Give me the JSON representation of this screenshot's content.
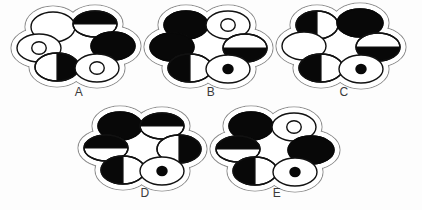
{
  "figure": {
    "title": "",
    "background_color": "#fdfdfd",
    "outline_color": "#8d8d8d",
    "cell_outline_color": "#111111",
    "fill_color": "#080808"
  },
  "clusters": [
    {
      "id": "A",
      "label": "A",
      "center": {
        "x": 79,
        "y": 45
      },
      "label_pos": {
        "x": 64,
        "y": 85
      },
      "cells": [
        {
          "position": "top-left",
          "cx": -26,
          "cy": -18,
          "rx": 22,
          "ry": 15,
          "state": "empty",
          "fill": "none"
        },
        {
          "position": "top-right",
          "cx": 16,
          "cy": -21,
          "rx": 22,
          "ry": 13,
          "state": "half-top",
          "fill": "top"
        },
        {
          "position": "left",
          "cx": -40,
          "cy": 3,
          "rx": 22,
          "ry": 14,
          "state": "ring-small",
          "fill": "inner-ring"
        },
        {
          "position": "right",
          "cx": 34,
          "cy": 1,
          "rx": 22,
          "ry": 14,
          "state": "full",
          "fill": "all"
        },
        {
          "position": "bottom-left",
          "cx": -22,
          "cy": 22,
          "rx": 22,
          "ry": 14,
          "state": "half-right",
          "fill": "right"
        },
        {
          "position": "bottom-right",
          "cx": 18,
          "cy": 23,
          "rx": 22,
          "ry": 14,
          "state": "ring-small",
          "fill": "inner-ring"
        }
      ]
    },
    {
      "id": "B",
      "label": "B",
      "center": {
        "x": 211,
        "y": 45
      },
      "label_pos": {
        "x": 196,
        "y": 85
      },
      "cells": [
        {
          "position": "top-left",
          "cx": -25,
          "cy": -20,
          "rx": 22,
          "ry": 14,
          "state": "full",
          "fill": "all"
        },
        {
          "position": "top-right",
          "cx": 17,
          "cy": -20,
          "rx": 22,
          "ry": 14,
          "state": "ring-small",
          "fill": "inner-ring"
        },
        {
          "position": "left",
          "cx": -39,
          "cy": 2,
          "rx": 22,
          "ry": 14,
          "state": "full",
          "fill": "all"
        },
        {
          "position": "right",
          "cx": 34,
          "cy": 3,
          "rx": 22,
          "ry": 14,
          "state": "half-bottom",
          "fill": "bottom"
        },
        {
          "position": "bottom-left",
          "cx": -21,
          "cy": 23,
          "rx": 22,
          "ry": 14,
          "state": "half-left",
          "fill": "left"
        },
        {
          "position": "bottom-right",
          "cx": 17,
          "cy": 24,
          "rx": 22,
          "ry": 14,
          "state": "dot-small",
          "fill": "inner-dot"
        }
      ]
    },
    {
      "id": "C",
      "label": "C",
      "center": {
        "x": 344,
        "y": 45
      },
      "label_pos": {
        "x": 329,
        "y": 85
      },
      "cells": [
        {
          "position": "top-left",
          "cx": -27,
          "cy": -20,
          "rx": 21,
          "ry": 14,
          "state": "half-left",
          "fill": "left"
        },
        {
          "position": "top-right",
          "cx": 16,
          "cy": -22,
          "rx": 23,
          "ry": 14,
          "state": "full",
          "fill": "all"
        },
        {
          "position": "left",
          "cx": -40,
          "cy": 1,
          "rx": 22,
          "ry": 14,
          "state": "empty",
          "fill": "none"
        },
        {
          "position": "right",
          "cx": 34,
          "cy": 2,
          "rx": 22,
          "ry": 14,
          "state": "half-bottom",
          "fill": "bottom"
        },
        {
          "position": "bottom-left",
          "cx": -23,
          "cy": 23,
          "rx": 22,
          "ry": 14,
          "state": "half-left",
          "fill": "left"
        },
        {
          "position": "bottom-right",
          "cx": 17,
          "cy": 24,
          "rx": 22,
          "ry": 14,
          "state": "dot-small",
          "fill": "inner-dot"
        }
      ]
    },
    {
      "id": "D",
      "label": "D",
      "center": {
        "x": 145,
        "y": 148
      },
      "label_pos": {
        "x": 130,
        "y": 186
      },
      "cells": [
        {
          "position": "top-left",
          "cx": -25,
          "cy": -22,
          "rx": 22,
          "ry": 14,
          "state": "full",
          "fill": "all"
        },
        {
          "position": "top-right",
          "cx": 17,
          "cy": -22,
          "rx": 22,
          "ry": 13,
          "state": "half-top",
          "fill": "top"
        },
        {
          "position": "left",
          "cx": -39,
          "cy": 0,
          "rx": 22,
          "ry": 13,
          "state": "half-top",
          "fill": "top"
        },
        {
          "position": "right",
          "cx": 34,
          "cy": 1,
          "rx": 22,
          "ry": 14,
          "state": "half-right",
          "fill": "right"
        },
        {
          "position": "bottom-left",
          "cx": -22,
          "cy": 22,
          "rx": 22,
          "ry": 14,
          "state": "half-left",
          "fill": "left"
        },
        {
          "position": "bottom-right",
          "cx": 17,
          "cy": 23,
          "rx": 22,
          "ry": 14,
          "state": "dot-small",
          "fill": "inner-dot"
        }
      ]
    },
    {
      "id": "E",
      "label": "E",
      "center": {
        "x": 277,
        "y": 148
      },
      "label_pos": {
        "x": 262,
        "y": 186
      },
      "cells": [
        {
          "position": "top-left",
          "cx": -26,
          "cy": -22,
          "rx": 22,
          "ry": 14,
          "state": "full",
          "fill": "all"
        },
        {
          "position": "top-right",
          "cx": 17,
          "cy": -21,
          "rx": 22,
          "ry": 14,
          "state": "ring-small",
          "fill": "inner-ring"
        },
        {
          "position": "left",
          "cx": -39,
          "cy": 1,
          "rx": 22,
          "ry": 13,
          "state": "half-top",
          "fill": "top"
        },
        {
          "position": "right",
          "cx": 34,
          "cy": 2,
          "rx": 23,
          "ry": 14,
          "state": "full",
          "fill": "all"
        },
        {
          "position": "bottom-left",
          "cx": -22,
          "cy": 23,
          "rx": 22,
          "ry": 14,
          "state": "half-left",
          "fill": "left"
        },
        {
          "position": "bottom-right",
          "cx": 18,
          "cy": 24,
          "rx": 22,
          "ry": 14,
          "state": "dot-small",
          "fill": "inner-dot"
        }
      ]
    }
  ]
}
